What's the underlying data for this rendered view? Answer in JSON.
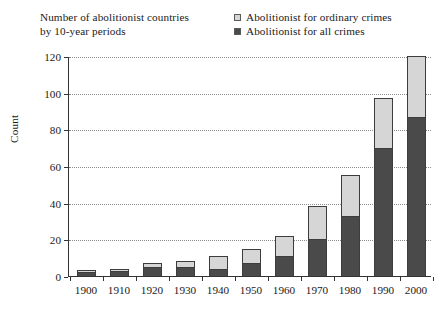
{
  "title": {
    "line1": "Number of abolitionist countries",
    "line2": "by 10-year periods"
  },
  "legend": {
    "position": "top-right",
    "entries": [
      {
        "label": "Abolitionist for ordinary crimes",
        "color": "#d6d6d6",
        "swatch": "light-gray-square"
      },
      {
        "label": "Abolitionist for all crimes",
        "color": "#4a4a4a",
        "swatch": "dark-gray-square"
      }
    ]
  },
  "axes": {
    "ylabel": "Count",
    "yticks": [
      "0",
      "20",
      "40",
      "60",
      "80",
      "100",
      "120"
    ],
    "xticks": [
      "1900",
      "1910",
      "1920",
      "1930",
      "1940",
      "1950",
      "1960",
      "1970",
      "1980",
      "1990",
      "2000"
    ]
  },
  "chart_data": {
    "type": "bar",
    "title": "Number of abolitionist countries by 10-year periods",
    "subtitle": "",
    "xlabel": "",
    "ylabel": "Count",
    "stacked": true,
    "grid": true,
    "ylim": [
      0,
      120
    ],
    "ytick_step": 20,
    "legend_position": "top-right",
    "categories": [
      "1900",
      "1910",
      "1920",
      "1930",
      "1940",
      "1950",
      "1960",
      "1970",
      "1980",
      "1990",
      "2000"
    ],
    "series": [
      {
        "name": "Abolitionist for all crimes",
        "color": "#4a4a4a",
        "values": [
          2,
          3,
          5,
          5,
          4,
          7,
          11,
          20,
          33,
          70,
          87
        ]
      },
      {
        "name": "Abolitionist for ordinary crimes",
        "color": "#d6d6d6",
        "values": [
          1,
          1,
          2,
          3,
          7,
          8,
          11,
          18,
          22,
          27,
          33
        ]
      }
    ],
    "totals": [
      3,
      4,
      7,
      8,
      11,
      15,
      22,
      38,
      55,
      97,
      120
    ]
  }
}
